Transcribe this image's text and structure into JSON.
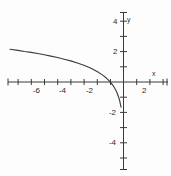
{
  "chart_data": {
    "type": "line",
    "title": "",
    "xlabel": "x",
    "ylabel": "y",
    "grid": false,
    "legend": null,
    "xlim": [
      -8.6,
      3.2
    ],
    "ylim": [
      -5.2,
      5.0
    ],
    "xticks": [
      -8,
      -7,
      -6,
      -5,
      -4,
      -3,
      -2,
      -1,
      1,
      2,
      3
    ],
    "yticks": [
      -5,
      -4,
      -3,
      -2,
      -1,
      1,
      2,
      3,
      4,
      5
    ],
    "xtick_labels_shown": [
      "-6",
      "-4",
      "-2",
      "2"
    ],
    "ytick_labels_shown": [
      "4",
      "2",
      "-2",
      "-4"
    ],
    "annotations": [],
    "series": [
      {
        "name": "curve",
        "description": "decreasing logarithmic curve with vertical asymptote at x = 0",
        "color": "#3b3b3b",
        "x": [
          -8.6,
          -8.0,
          -7.5,
          -7.0,
          -6.5,
          -6.0,
          -5.5,
          -5.0,
          -4.5,
          -4.0,
          -3.5,
          -3.0,
          -2.5,
          -2.0,
          -1.6,
          -1.3,
          -1.1,
          -1.0,
          -0.9,
          -0.8,
          -0.7,
          -0.6,
          -0.5,
          -0.42,
          -0.35,
          -0.3,
          -0.26,
          -0.23,
          -0.21,
          -0.2,
          -0.19
        ],
        "y": [
          2.15,
          2.08,
          2.01,
          1.95,
          1.87,
          1.79,
          1.7,
          1.61,
          1.5,
          1.39,
          1.25,
          1.1,
          0.92,
          0.69,
          0.47,
          0.26,
          0.09,
          0.0,
          -0.11,
          -0.22,
          -0.36,
          -0.51,
          -0.69,
          -0.87,
          -1.05,
          -1.2,
          -1.35,
          -1.47,
          -1.56,
          -1.61,
          -1.66
        ]
      }
    ]
  },
  "labels": {
    "x_axis_name": "x",
    "y_axis_name": "y",
    "x_neg_6": "-6",
    "x_neg_4": "-4",
    "x_neg_2": "-2",
    "x_pos_2": "2",
    "y_pos_4": "4",
    "y_pos_2": "2",
    "y_neg_2": "-2",
    "y_neg_4": "-4"
  },
  "colors": {
    "axis": "#3a3a3a",
    "curve": "#3b3b3b",
    "text": "#2b2b2b",
    "background": "#fdfdfd"
  }
}
